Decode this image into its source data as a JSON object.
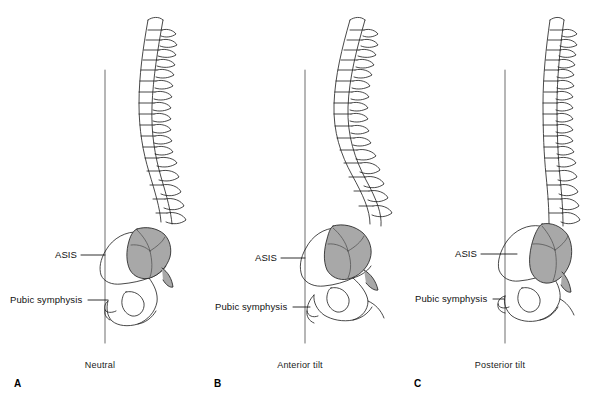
{
  "figure": {
    "background_color": "#ffffff",
    "line_color": "#1a1a1a",
    "sacrum_fill_color": "#a8a8a8",
    "plumb_line_color": "#7a7a7a",
    "width": 600,
    "height": 399
  },
  "panels": [
    {
      "letter": "A",
      "caption": "Neutral",
      "labels": {
        "asis": "ASIS",
        "pubic_symphysis": "Pubic symphysis"
      }
    },
    {
      "letter": "B",
      "caption": "Anterior tilt",
      "labels": {
        "asis": "ASIS",
        "pubic_symphysis": "Pubic symphysis"
      }
    },
    {
      "letter": "C",
      "caption": "Posterior tilt",
      "labels": {
        "asis": "ASIS",
        "pubic_symphysis": "Pubic symphysis"
      }
    }
  ]
}
